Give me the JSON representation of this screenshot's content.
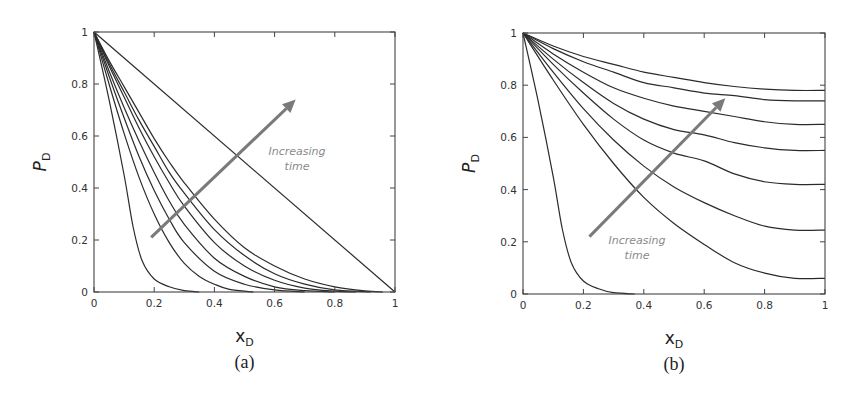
{
  "chart_data": [
    {
      "type": "line",
      "panel": "(a)",
      "caption": "(a)",
      "title": "",
      "xlabel": "x_D",
      "xlabel_main": "x",
      "xlabel_sub": "D",
      "ylabel": "P_D",
      "ylabel_main": "P",
      "ylabel_sub": "D",
      "xlim": [
        0,
        1
      ],
      "ylim": [
        0,
        1
      ],
      "xticks": [
        "0",
        "0.2",
        "0.4",
        "0.6",
        "0.8",
        "1"
      ],
      "yticks": [
        "0",
        "0.2",
        "0.4",
        "0.6",
        "0.8",
        "1"
      ],
      "grid": false,
      "annotation": {
        "line1": "Increasing",
        "line2": "time",
        "arrow_from": [
          0.19,
          0.21
        ],
        "arrow_to": [
          0.67,
          0.74
        ]
      },
      "series": [
        {
          "name": "t1",
          "x": [
            0,
            0.05,
            0.1,
            0.13,
            0.16,
            0.2,
            0.25,
            0.3,
            0.35
          ],
          "values": [
            1,
            0.74,
            0.45,
            0.25,
            0.12,
            0.05,
            0.02,
            0.005,
            0
          ]
        },
        {
          "name": "t2",
          "x": [
            0,
            0.05,
            0.1,
            0.15,
            0.2,
            0.25,
            0.3,
            0.35,
            0.4,
            0.45,
            0.53
          ],
          "values": [
            1,
            0.8,
            0.61,
            0.44,
            0.3,
            0.19,
            0.11,
            0.06,
            0.03,
            0.01,
            0
          ]
        },
        {
          "name": "t3",
          "x": [
            0,
            0.05,
            0.1,
            0.15,
            0.2,
            0.25,
            0.3,
            0.4,
            0.5,
            0.6,
            0.7
          ],
          "values": [
            1,
            0.83,
            0.67,
            0.52,
            0.39,
            0.28,
            0.19,
            0.08,
            0.03,
            0.008,
            0
          ]
        },
        {
          "name": "t4",
          "x": [
            0,
            0.05,
            0.1,
            0.15,
            0.2,
            0.25,
            0.3,
            0.4,
            0.5,
            0.6,
            0.7,
            0.8
          ],
          "values": [
            1,
            0.85,
            0.71,
            0.58,
            0.46,
            0.35,
            0.26,
            0.13,
            0.06,
            0.02,
            0.005,
            0
          ]
        },
        {
          "name": "t5",
          "x": [
            0,
            0.05,
            0.1,
            0.15,
            0.2,
            0.25,
            0.3,
            0.4,
            0.5,
            0.6,
            0.7,
            0.8,
            0.87
          ],
          "values": [
            1,
            0.87,
            0.75,
            0.63,
            0.52,
            0.42,
            0.33,
            0.19,
            0.1,
            0.045,
            0.015,
            0.003,
            0
          ]
        },
        {
          "name": "t6",
          "x": [
            0,
            0.05,
            0.1,
            0.15,
            0.2,
            0.25,
            0.3,
            0.4,
            0.5,
            0.6,
            0.7,
            0.8,
            0.92
          ],
          "values": [
            1,
            0.88,
            0.77,
            0.66,
            0.56,
            0.46,
            0.38,
            0.24,
            0.14,
            0.07,
            0.03,
            0.008,
            0
          ]
        },
        {
          "name": "t7",
          "x": [
            0,
            0.05,
            0.1,
            0.15,
            0.2,
            0.25,
            0.3,
            0.4,
            0.5,
            0.6,
            0.7,
            0.8,
            0.9,
            0.96
          ],
          "values": [
            1,
            0.89,
            0.79,
            0.69,
            0.59,
            0.5,
            0.42,
            0.28,
            0.17,
            0.1,
            0.05,
            0.02,
            0.004,
            0
          ]
        },
        {
          "name": "steady",
          "x": [
            0,
            1
          ],
          "values": [
            1,
            0
          ]
        }
      ]
    },
    {
      "type": "line",
      "panel": "(b)",
      "caption": "(b)",
      "title": "",
      "xlabel": "x_D",
      "xlabel_main": "x",
      "xlabel_sub": "D",
      "ylabel": "P_D",
      "ylabel_main": "P",
      "ylabel_sub": "D",
      "xlim": [
        0,
        1
      ],
      "ylim": [
        0,
        1
      ],
      "xticks": [
        "0",
        "0.2",
        "0.4",
        "0.6",
        "0.8",
        "1"
      ],
      "yticks": [
        "0",
        "0.2",
        "0.4",
        "0.6",
        "0.8",
        "1"
      ],
      "grid": false,
      "annotation": {
        "line1": "Increasing",
        "line2": "time",
        "arrow_from": [
          0.22,
          0.22
        ],
        "arrow_to": [
          0.67,
          0.75
        ]
      },
      "series": [
        {
          "name": "t1",
          "x": [
            0,
            0.05,
            0.1,
            0.13,
            0.16,
            0.2,
            0.25,
            0.3,
            0.37
          ],
          "values": [
            1,
            0.74,
            0.45,
            0.25,
            0.12,
            0.05,
            0.02,
            0.005,
            0
          ]
        },
        {
          "name": "t2",
          "x": [
            0,
            0.1,
            0.2,
            0.3,
            0.4,
            0.5,
            0.6,
            0.7,
            0.8,
            0.9,
            1.0
          ],
          "values": [
            1,
            0.82,
            0.65,
            0.5,
            0.37,
            0.27,
            0.19,
            0.12,
            0.08,
            0.06,
            0.06
          ]
        },
        {
          "name": "t3",
          "x": [
            0,
            0.1,
            0.2,
            0.3,
            0.4,
            0.5,
            0.6,
            0.7,
            0.8,
            0.9,
            1.0
          ],
          "values": [
            1,
            0.85,
            0.71,
            0.59,
            0.49,
            0.41,
            0.35,
            0.3,
            0.26,
            0.245,
            0.245
          ]
        },
        {
          "name": "t4",
          "x": [
            0,
            0.1,
            0.2,
            0.3,
            0.4,
            0.5,
            0.6,
            0.7,
            0.8,
            0.9,
            1.0
          ],
          "values": [
            1,
            0.88,
            0.77,
            0.67,
            0.59,
            0.54,
            0.51,
            0.46,
            0.43,
            0.42,
            0.42
          ]
        },
        {
          "name": "t5",
          "x": [
            0,
            0.1,
            0.2,
            0.3,
            0.4,
            0.5,
            0.6,
            0.7,
            0.8,
            0.9,
            1.0
          ],
          "values": [
            1,
            0.9,
            0.81,
            0.73,
            0.67,
            0.63,
            0.61,
            0.58,
            0.56,
            0.55,
            0.55
          ]
        },
        {
          "name": "t6",
          "x": [
            0,
            0.1,
            0.2,
            0.3,
            0.4,
            0.5,
            0.6,
            0.7,
            0.8,
            0.9,
            1.0
          ],
          "values": [
            1,
            0.92,
            0.85,
            0.79,
            0.75,
            0.72,
            0.7,
            0.68,
            0.66,
            0.65,
            0.65
          ]
        },
        {
          "name": "t7",
          "x": [
            0,
            0.1,
            0.2,
            0.3,
            0.4,
            0.5,
            0.6,
            0.7,
            0.8,
            0.9,
            1.0
          ],
          "values": [
            1,
            0.94,
            0.89,
            0.85,
            0.81,
            0.79,
            0.77,
            0.76,
            0.745,
            0.74,
            0.74
          ]
        },
        {
          "name": "t8",
          "x": [
            0,
            0.1,
            0.2,
            0.3,
            0.4,
            0.5,
            0.6,
            0.7,
            0.8,
            0.9,
            1.0
          ],
          "values": [
            1,
            0.95,
            0.91,
            0.88,
            0.85,
            0.83,
            0.81,
            0.795,
            0.785,
            0.78,
            0.78
          ]
        }
      ]
    }
  ],
  "layout": {
    "panels": [
      {
        "left": 94,
        "top": 32,
        "width": 301,
        "height": 260
      },
      {
        "left": 523,
        "top": 33,
        "width": 302,
        "height": 261
      }
    ]
  }
}
